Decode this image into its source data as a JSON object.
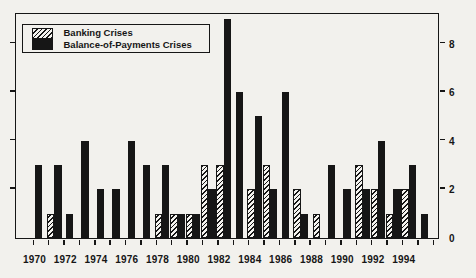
{
  "legend": {
    "items": [
      {
        "label": "Banking Crises",
        "swatch": "hatched"
      },
      {
        "label": "Balance-of-Payments Crises",
        "swatch": "solid"
      }
    ]
  },
  "chart_data": {
    "type": "bar",
    "title": "",
    "categories": [
      1970,
      1971,
      1972,
      1973,
      1974,
      1975,
      1976,
      1977,
      1978,
      1979,
      1980,
      1981,
      1982,
      1983,
      1984,
      1985,
      1986,
      1987,
      1988,
      1989,
      1990,
      1991,
      1992,
      1993,
      1994,
      1995
    ],
    "series": [
      {
        "name": "Banking Crises",
        "style": "hatched",
        "values": [
          0,
          1,
          0,
          0,
          0,
          0,
          0,
          0,
          1,
          1,
          1,
          3,
          3,
          0,
          2,
          3,
          0,
          2,
          1,
          0,
          0,
          3,
          2,
          1,
          2,
          0
        ]
      },
      {
        "name": "Balance-of-Payments Crises",
        "style": "solid",
        "values": [
          3,
          3,
          1,
          4,
          2,
          2,
          4,
          3,
          3,
          1,
          1,
          2,
          9,
          6,
          5,
          2,
          6,
          1,
          0,
          3,
          2,
          2,
          4,
          2,
          3,
          1
        ]
      }
    ],
    "xtick_labels": [
      "1970",
      "1972",
      "1974",
      "1976",
      "1978",
      "1980",
      "1982",
      "1984",
      "1986",
      "1988",
      "1990",
      "1992",
      "1994"
    ],
    "right_axis_tick_values": [
      0,
      2,
      4,
      6,
      8
    ],
    "ylim": [
      0,
      9.2
    ],
    "grid": false,
    "legend_position": "top-left",
    "bar_color": "#161616",
    "background_color": "#f2f1ed"
  }
}
